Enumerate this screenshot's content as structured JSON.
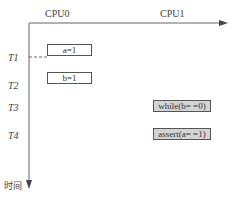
{
  "diagram": {
    "columns": [
      {
        "label": "CPU0"
      },
      {
        "label": "CPU1"
      }
    ],
    "time_marks": [
      {
        "label": "T1"
      },
      {
        "label": "T2"
      },
      {
        "label": "T3"
      },
      {
        "label": "T4"
      }
    ],
    "time_axis_label": "时间",
    "cpu0_ops": [
      {
        "text": "a=1",
        "time": "T1"
      },
      {
        "text": "b=1",
        "time": "T2"
      }
    ],
    "cpu1_ops": [
      {
        "text": "while(b= =0)",
        "time": "T3"
      },
      {
        "text": "assert(a= =1)",
        "time": "T4"
      }
    ],
    "colors": {
      "axis": "#666666",
      "box_border": "#555555",
      "shaded_box_fill": "#d4d4d4"
    }
  }
}
